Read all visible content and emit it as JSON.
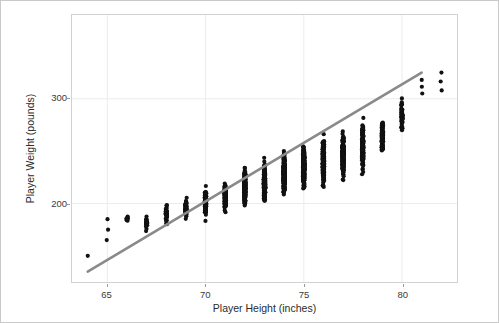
{
  "chart_data": {
    "type": "scatter",
    "title": "",
    "xlabel": "Player Height (inches)",
    "ylabel": "Player Weight (pounds)",
    "xlim": [
      63.2,
      82.8
    ],
    "ylim": [
      125,
      380
    ],
    "xticks": [
      65,
      70,
      75,
      80
    ],
    "yticks": [
      200,
      300
    ],
    "xtick_labels": [
      "65",
      "70",
      "75",
      "80"
    ],
    "ytick_labels": [
      "200",
      "300"
    ],
    "grid": true,
    "grid_color": "#ececec",
    "point_color": "#111111",
    "point_size": 2.1,
    "panel_background": "#ffffff",
    "legend": "none",
    "columns": [
      {
        "x": 64,
        "n": 1,
        "min": 150,
        "max": 150,
        "mode": 150
      },
      {
        "x": 65,
        "n": 3,
        "min": 165,
        "max": 185,
        "mode": 180
      },
      {
        "x": 66,
        "n": 9,
        "min": 170,
        "max": 200,
        "mode": 185
      },
      {
        "x": 67,
        "n": 22,
        "min": 145,
        "max": 215,
        "mode": 180
      },
      {
        "x": 68,
        "n": 34,
        "min": 150,
        "max": 235,
        "mode": 190
      },
      {
        "x": 69,
        "n": 58,
        "min": 165,
        "max": 242,
        "mode": 195
      },
      {
        "x": 70,
        "n": 86,
        "min": 152,
        "max": 265,
        "mode": 200
      },
      {
        "x": 71,
        "n": 120,
        "min": 162,
        "max": 282,
        "mode": 205
      },
      {
        "x": 72,
        "n": 170,
        "min": 163,
        "max": 322,
        "mode": 215
      },
      {
        "x": 73,
        "n": 205,
        "min": 170,
        "max": 332,
        "mode": 220
      },
      {
        "x": 74,
        "n": 230,
        "min": 168,
        "max": 345,
        "mode": 228
      },
      {
        "x": 75,
        "n": 250,
        "min": 185,
        "max": 345,
        "mode": 235
      },
      {
        "x": 76,
        "n": 245,
        "min": 183,
        "max": 358,
        "mode": 240
      },
      {
        "x": 77,
        "n": 210,
        "min": 196,
        "max": 352,
        "mode": 248
      },
      {
        "x": 78,
        "n": 150,
        "min": 188,
        "max": 365,
        "mode": 255
      },
      {
        "x": 79,
        "n": 95,
        "min": 222,
        "max": 352,
        "mode": 262
      },
      {
        "x": 80,
        "n": 45,
        "min": 252,
        "max": 372,
        "mode": 285
      },
      {
        "x": 81,
        "n": 3,
        "min": 305,
        "max": 318,
        "mode": 310
      },
      {
        "x": 82,
        "n": 3,
        "min": 308,
        "max": 325,
        "mode": 312
      }
    ],
    "trend_line": {
      "color": "#8a8a8a",
      "width": 2.6,
      "x_start": 64.0,
      "y_start": 135,
      "x_end": 81.0,
      "y_end": 325
    }
  },
  "axes": {
    "x_label": "Player Height (inches)",
    "y_label": "Player Weight (pounds)"
  }
}
